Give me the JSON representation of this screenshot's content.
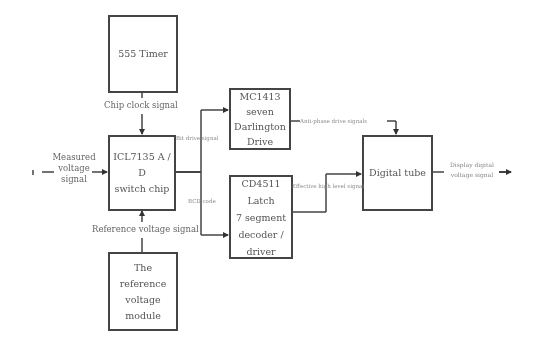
{
  "diagram": {
    "type": "block-diagram",
    "blocks": {
      "timer": {
        "label": "555 Timer"
      },
      "adc": {
        "label": "ICL7135 A / D\nswitch chip"
      },
      "darlington": {
        "label": "MC1413 seven\nDarlington\nDrive"
      },
      "latch": {
        "label": "CD4511 Latch\n7 segment\ndecoder /\ndriver"
      },
      "tube": {
        "label": "Digital tube"
      },
      "reference": {
        "label": "The reference\nvoltage module"
      }
    },
    "signals": {
      "clock": "Chip clock signal",
      "measured": "Measured\nvoltage\nsignal",
      "reference": "Reference voltage signal",
      "bit_drive": "Bit drive signal",
      "bcd": "BCD code",
      "anti_phase": "Anti-phase drive signals",
      "effective_high": "Effective high level signal",
      "display_output": "Display digital\nvoltage signal"
    },
    "connections": [
      {
        "from": "measured-input",
        "to": "adc",
        "label": "Measured voltage signal"
      },
      {
        "from": "timer",
        "to": "adc",
        "label": "Chip clock signal"
      },
      {
        "from": "reference",
        "to": "adc",
        "label": "Reference voltage signal"
      },
      {
        "from": "adc",
        "to": "darlington",
        "label": "Bit drive signal"
      },
      {
        "from": "adc",
        "to": "latch",
        "label": "BCD code"
      },
      {
        "from": "darlington",
        "to": "tube",
        "label": "Anti-phase drive signals"
      },
      {
        "from": "latch",
        "to": "tube",
        "label": "Effective high level signal"
      },
      {
        "from": "tube",
        "to": "output",
        "label": "Display digital voltage signal"
      }
    ]
  },
  "colors": {
    "line": "#444444",
    "text": "#555555",
    "background": "#ffffff"
  }
}
